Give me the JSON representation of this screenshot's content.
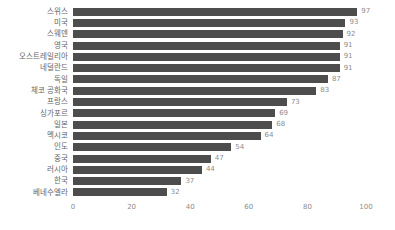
{
  "chart_data": {
    "type": "bar",
    "orientation": "horizontal",
    "title": "",
    "xlabel": "",
    "ylabel": "",
    "categories": [
      "스위스",
      "미국",
      "스웨덴",
      "영국",
      "오스트레일리아",
      "네덜란드",
      "독일",
      "체코 공화국",
      "프랑스",
      "싱가포르",
      "일본",
      "멕시코",
      "인도",
      "중국",
      "러시아",
      "한국",
      "베네수엘라"
    ],
    "values": [
      97,
      93,
      92,
      91,
      91,
      91,
      87,
      83,
      73,
      69,
      68,
      64,
      54,
      47,
      44,
      37,
      32
    ],
    "xlim": [
      0,
      100
    ],
    "xticks": [
      0,
      20,
      40,
      60,
      80,
      100
    ],
    "grid": false,
    "legend_position": "none",
    "value_labels_shown": true,
    "bar_color": "#4d4d4d",
    "category_label_color": "#666666",
    "value_label_color": "#8c8c8c",
    "tick_label_color": "#8c8c8c",
    "background_color": "#ffffff"
  }
}
